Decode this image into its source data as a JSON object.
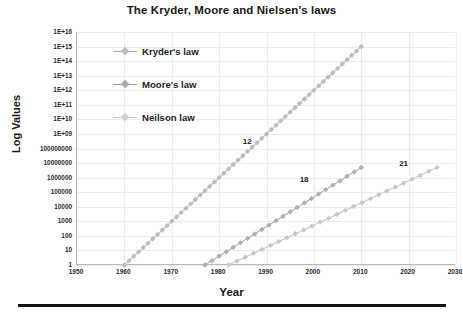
{
  "chart_data": {
    "type": "line",
    "title": "The Kryder, Moore and Nielsen’s laws",
    "xlabel": "Year",
    "ylabel": "Log Values",
    "yscale": "log",
    "ylim": [
      1,
      1e+16
    ],
    "xlim": [
      1950,
      2030
    ],
    "grid": true,
    "legend_position": "inside-upper-left",
    "xticks": [
      "1950",
      "1960",
      "1970",
      "1980",
      "1990",
      "2000",
      "2010",
      "2020",
      "2030"
    ],
    "xtick_values": [
      1950,
      1960,
      1970,
      1980,
      1990,
      2000,
      2010,
      2020,
      2030
    ],
    "yticks": [
      "1E+16",
      "1E+15",
      "1E+14",
      "1E+13",
      "1E+12",
      "1E+11",
      "1E+10",
      "1E+09",
      "100000000",
      "10000000",
      "1000000",
      "100000",
      "10000",
      "1000",
      "100",
      "10",
      "1"
    ],
    "ytick_values": [
      1e+16,
      1000000000000000.0,
      100000000000000.0,
      10000000000000.0,
      1000000000000.0,
      100000000000.0,
      10000000000.0,
      1000000000.0,
      100000000.0,
      10000000.0,
      1000000.0,
      100000.0,
      10000.0,
      1000.0,
      100,
      10,
      1
    ],
    "series": [
      {
        "name": "Kryder's law",
        "color": "#bdbdbd",
        "doubling_months": 12,
        "annotation": "12",
        "x": [
          1960,
          1961.7,
          1963.4,
          1965.1,
          1966.8,
          1968.5,
          1970.2,
          1971.9,
          1973.6,
          1975.3,
          1977.0,
          1978.7,
          1980.4,
          1982.1,
          1983.8,
          1985.5,
          1987.2,
          1988.9,
          1990.6,
          1992.3,
          1994.0,
          1995.7,
          1997.4,
          1999.1,
          2000.8,
          2002.5,
          2004.2,
          2005.9,
          2007.6,
          2009.3,
          2010.0
        ],
        "y": [
          1,
          10,
          100,
          1000,
          10000,
          100000,
          1000000,
          10000000,
          100000000,
          1000000000.0,
          10000000000.0,
          100000000000.0,
          1000000000000.0,
          10000000000000.0,
          100000000000000.0,
          1000000000000000.0,
          1000000000000000.0,
          1000000000000000.0,
          1000000000000000.0,
          1000000000000000.0,
          1000000000000000.0,
          1000000000000000.0,
          1000000000000000.0,
          1000000000000000.0,
          1000000000000000.0,
          1000000000000000.0,
          1000000000000000.0,
          1000000000000000.0,
          1000000000000000.0,
          1000000000000000.0,
          1000000000000000.0
        ]
      },
      {
        "name": "Moore's law",
        "color": "#b0b0b0",
        "doubling_months": 18,
        "annotation": "18",
        "x_start": 1977,
        "x_end": 2010,
        "y_start": 1,
        "y_end": 5000000
      },
      {
        "name": "Neilson law",
        "color": "#c9c9c9",
        "doubling_months": 21,
        "annotation": "21",
        "x_start": 1982,
        "x_end": 2026,
        "y_start": 1,
        "y_end": 5000000
      }
    ],
    "annotations": [
      {
        "text": "12",
        "x": 1985,
        "y": 300000000.0
      },
      {
        "text": "18",
        "x": 1997,
        "y": 700000
      },
      {
        "text": "21",
        "x": 2018,
        "y": 9000000
      }
    ]
  },
  "legend": {
    "items": [
      {
        "label": "Kryder's law"
      },
      {
        "label": "Moore's law"
      },
      {
        "label": "Neilson law"
      }
    ]
  }
}
